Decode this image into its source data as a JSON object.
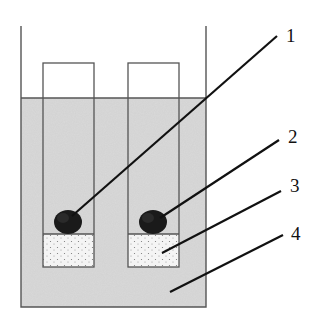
{
  "diagram": {
    "type": "apparatus-cross-section",
    "colors": {
      "liquid": "#d9d9d9",
      "outline": "#555555",
      "sediment": "#f3f3f3",
      "blob": "#1a1a1a",
      "leader": "#111111"
    },
    "labels": [
      {
        "id": "1",
        "text": "1",
        "target": "dark sample mass in left tube"
      },
      {
        "id": "2",
        "text": "2",
        "target": "dark sample mass in right tube"
      },
      {
        "id": "3",
        "text": "3",
        "target": "speckled layer at bottom of tube"
      },
      {
        "id": "4",
        "text": "4",
        "target": "liquid in outer container"
      }
    ]
  }
}
